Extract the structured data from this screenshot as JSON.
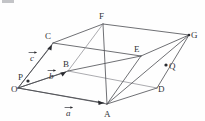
{
  "figure": {
    "background_color": "#fefefe",
    "edge_color": "#4a4b51",
    "label_color": "#33343a",
    "vertices": [
      {
        "name": "O",
        "label": "O",
        "x": 18,
        "y": 88,
        "label_x": 11,
        "label_y": 92
      },
      {
        "name": "A",
        "label": "A",
        "x": 107,
        "y": 104,
        "label_x": 104,
        "label_y": 117
      },
      {
        "name": "B",
        "label": "B",
        "x": 68,
        "y": 71,
        "label_x": 63,
        "label_y": 67
      },
      {
        "name": "C",
        "label": "C",
        "x": 53,
        "y": 43,
        "label_x": 45,
        "label_y": 39
      },
      {
        "name": "D",
        "label": "D",
        "x": 157,
        "y": 88,
        "label_x": 158,
        "label_y": 92
      },
      {
        "name": "E",
        "label": "E",
        "x": 141,
        "y": 56,
        "label_x": 134,
        "label_y": 52
      },
      {
        "name": "F",
        "label": "F",
        "x": 103,
        "y": 24,
        "label_x": 99,
        "label_y": 19
      },
      {
        "name": "G",
        "label": "G",
        "x": 189,
        "y": 35,
        "label_x": 191,
        "label_y": 38
      }
    ],
    "points": [
      {
        "name": "P",
        "label": "P",
        "x": 28,
        "y": 81,
        "label_x": 18,
        "label_y": 80
      },
      {
        "name": "Q",
        "label": "Q",
        "x": 166,
        "y": 65,
        "label_x": 169,
        "label_y": 69
      }
    ],
    "vectors": [
      {
        "name": "a",
        "label": "a",
        "from": "O",
        "to": "A",
        "label_x": 66,
        "label_y": 116
      },
      {
        "name": "b",
        "label": "b",
        "from": "O",
        "to": "B",
        "label_x": 49,
        "label_y": 79
      },
      {
        "name": "c",
        "label": "c",
        "from": "O",
        "to": "C",
        "label_x": 30,
        "label_y": 61
      }
    ]
  }
}
